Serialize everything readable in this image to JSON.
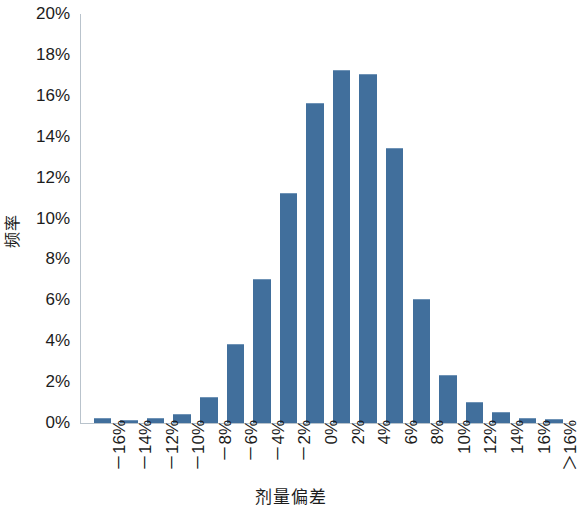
{
  "chart_data": {
    "type": "bar",
    "title": "",
    "xlabel": "剂量偏差",
    "ylabel": "频率",
    "ylim": [
      0,
      20
    ],
    "y_tick_labels": [
      "20%",
      "18%",
      "16%",
      "14%",
      "12%",
      "10%",
      "8%",
      "6%",
      "4%",
      "2%",
      "0%"
    ],
    "y_tick_values": [
      20,
      18,
      16,
      14,
      12,
      10,
      8,
      6,
      4,
      2,
      0
    ],
    "grid": false,
    "legend": null,
    "categories": [
      "－16%",
      "－14%",
      "－12%",
      "－10%",
      "－8%",
      "－6%",
      "－4%",
      "－2%",
      "0%",
      "2%",
      "4%",
      "6%",
      "8%",
      "10%",
      "12%",
      "14%",
      "16%",
      "＞16%"
    ],
    "values": [
      0.2,
      0.1,
      0.2,
      0.4,
      1.2,
      3.8,
      7.0,
      11.2,
      15.6,
      17.2,
      17.0,
      13.4,
      6.0,
      2.3,
      1.0,
      0.5,
      0.2,
      0.15
    ],
    "series": [
      {
        "name": "频率",
        "color": "#416f9c",
        "values": [
          0.2,
          0.1,
          0.2,
          0.4,
          1.2,
          3.8,
          7.0,
          11.2,
          15.6,
          17.2,
          17.0,
          13.4,
          6.0,
          2.3,
          1.0,
          0.5,
          0.2,
          0.15
        ]
      }
    ]
  },
  "style": {
    "bar_color": "#416f9c",
    "bar_top_color": "#6f93b6",
    "axis_color": "#b9c3cc",
    "text_color": "#1c1c1c",
    "background": "#ffffff"
  }
}
